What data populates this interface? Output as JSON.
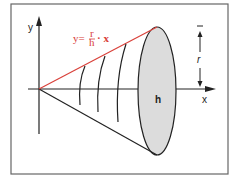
{
  "diagram": {
    "type": "cone-of-revolution",
    "labels": {
      "y_axis": "y",
      "x_axis": "x",
      "height": "h",
      "radius": "r",
      "equation": "y = r/h · x"
    },
    "equation_parts": {
      "lhs": "y=",
      "numerator": "r",
      "denominator": "h",
      "rhs": "· x"
    },
    "colors": {
      "line": "#222222",
      "slant_line": "#d9413a",
      "equation": "#d9413a",
      "base_fill": "#d9d9d9",
      "frame": "#555555"
    }
  }
}
